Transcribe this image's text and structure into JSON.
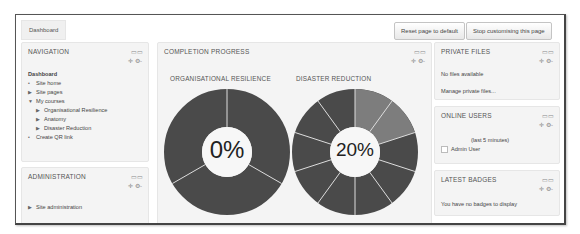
{
  "breadcrumb": {
    "label": "Dashboard"
  },
  "header": {
    "reset_button": "Reset page to default",
    "stop_button": "Stop customising this page"
  },
  "icons": {
    "dock": "▭▭",
    "controls": "✛ ⚙-"
  },
  "navigation": {
    "title": "NAVIGATION",
    "items": [
      {
        "label": "Dashboard",
        "level": 0,
        "marker": "",
        "bold": true
      },
      {
        "label": "Site home",
        "level": 0,
        "marker": "•"
      },
      {
        "label": "Site pages",
        "level": 0,
        "marker": "▶"
      },
      {
        "label": "My courses",
        "level": 0,
        "marker": "▼"
      },
      {
        "label": "Organisational Resilience",
        "level": 1,
        "marker": "▶"
      },
      {
        "label": "Anatomy",
        "level": 1,
        "marker": "▶"
      },
      {
        "label": "Disaster Reduction",
        "level": 1,
        "marker": "▶"
      },
      {
        "label": "Create QR link",
        "level": 0,
        "marker": "•"
      }
    ]
  },
  "administration": {
    "title": "ADMINISTRATION",
    "items": [
      {
        "label": "Site administration",
        "marker": "▶"
      }
    ],
    "search_value": ""
  },
  "completion_progress": {
    "title": "COMPLETION PROGRESS",
    "courses": [
      {
        "name": "ORGANISATIONAL RESILIENCE",
        "percent_label": "0%",
        "segments": 3,
        "completed": 0
      },
      {
        "name": "DISASTER REDUCTION",
        "percent_label": "20%",
        "segments": 10,
        "completed": 2
      }
    ],
    "colors": {
      "complete": "#7d7d7d",
      "incomplete": "#4a4a4a",
      "separator": "#dddddd"
    }
  },
  "private_files": {
    "title": "PRIVATE FILES",
    "empty_text": "No files available",
    "manage_link": "Manage private files..."
  },
  "online_users": {
    "title": "ONLINE USERS",
    "period": "(last 5 minutes)",
    "users": [
      "Admin User"
    ]
  },
  "latest_badges": {
    "title": "LATEST BADGES",
    "empty_text": "You have no badges to display"
  }
}
